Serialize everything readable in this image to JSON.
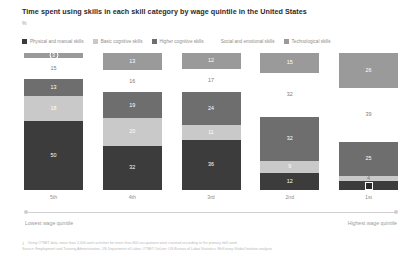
{
  "header": {
    "title": "Time spent using skills in each skill category by wage quintile in the United States",
    "subtitle": "%"
  },
  "legend": {
    "items": [
      {
        "label": "Physical and manual skills",
        "color": "#3c3c3c"
      },
      {
        "label": "Basic cognitive skills",
        "color": "#c9c9c9"
      },
      {
        "label": "Higher cognitive skills",
        "color": "#6e6e6e"
      },
      {
        "label": "Social and emotional skills",
        "color": "#ffffff"
      },
      {
        "label": "Technological skills",
        "color": "#9a9a9a"
      }
    ]
  },
  "axis": {
    "low_label": "Lowest wage quintile",
    "high_label": "Highest wage quintile"
  },
  "footnotes": {
    "mark": "1",
    "note": "Using O*NET data, more than 2,000 work activities for more than 800 occupations were counted according to the primary skill used.",
    "source": "Source: Employment and Training Administration, US Department of Labor, O*NET OnLine; US Bureau of Labor Statistics; McKinsey Global Institute analysis"
  },
  "chart_data": {
    "type": "bar",
    "title": "Time spent using skills in each skill category by wage quintile in the United States",
    "subtitle": "%",
    "xlabel": "",
    "ylabel": "%",
    "ylim": [
      0,
      100
    ],
    "grid": false,
    "legend_position": "top",
    "stacked": true,
    "categories": [
      "5th",
      "4th",
      "3rd",
      "2nd",
      "1st"
    ],
    "series": [
      {
        "name": "Technological skills",
        "color": "#9a9a9a",
        "values": [
          3,
          13,
          12,
          15,
          26
        ]
      },
      {
        "name": "Social and emotional skills",
        "color": "#ffffff",
        "values": [
          15,
          16,
          17,
          32,
          39
        ]
      },
      {
        "name": "Higher cognitive skills",
        "color": "#6e6e6e",
        "values": [
          13,
          19,
          24,
          32,
          25
        ]
      },
      {
        "name": "Basic cognitive skills",
        "color": "#c9c9c9",
        "values": [
          18,
          20,
          11,
          9,
          4
        ]
      },
      {
        "name": "Physical and manual skills",
        "color": "#3c3c3c",
        "values": [
          50,
          32,
          36,
          12,
          6
        ]
      }
    ]
  },
  "columns": [
    {
      "name": "5th",
      "segments": [
        {
          "value": "3",
          "color": "#9a9a9a",
          "text": "#ffffff",
          "pct": 3,
          "marker": "circle"
        },
        {
          "value": "15",
          "color": "#ffffff",
          "text": "#7a7a7a",
          "pct": 15,
          "marker": "none"
        },
        {
          "value": "13",
          "color": "#6e6e6e",
          "text": "#ffffff",
          "pct": 13,
          "marker": "none"
        },
        {
          "value": "18",
          "color": "#c9c9c9",
          "text": "#ffffff",
          "pct": 18,
          "marker": "none"
        },
        {
          "value": "50",
          "color": "#3c3c3c",
          "text": "#ffffff",
          "pct": 50,
          "marker": "none"
        }
      ]
    },
    {
      "name": "4th",
      "segments": [
        {
          "value": "13",
          "color": "#9a9a9a",
          "text": "#ffffff",
          "pct": 13,
          "marker": "none"
        },
        {
          "value": "16",
          "color": "#ffffff",
          "text": "#7a7a7a",
          "pct": 16,
          "marker": "none"
        },
        {
          "value": "19",
          "color": "#6e6e6e",
          "text": "#ffffff",
          "pct": 19,
          "marker": "none"
        },
        {
          "value": "20",
          "color": "#c9c9c9",
          "text": "#ffffff",
          "pct": 20,
          "marker": "none"
        },
        {
          "value": "32",
          "color": "#3c3c3c",
          "text": "#ffffff",
          "pct": 32,
          "marker": "none"
        }
      ]
    },
    {
      "name": "3rd",
      "segments": [
        {
          "value": "12",
          "color": "#9a9a9a",
          "text": "#ffffff",
          "pct": 12,
          "marker": "none"
        },
        {
          "value": "17",
          "color": "#ffffff",
          "text": "#7a7a7a",
          "pct": 17,
          "marker": "none"
        },
        {
          "value": "24",
          "color": "#6e6e6e",
          "text": "#ffffff",
          "pct": 24,
          "marker": "none"
        },
        {
          "value": "11",
          "color": "#c9c9c9",
          "text": "#ffffff",
          "pct": 11,
          "marker": "none"
        },
        {
          "value": "36",
          "color": "#3c3c3c",
          "text": "#ffffff",
          "pct": 36,
          "marker": "none"
        }
      ]
    },
    {
      "name": "2nd",
      "segments": [
        {
          "value": "15",
          "color": "#9a9a9a",
          "text": "#ffffff",
          "pct": 15,
          "marker": "none"
        },
        {
          "value": "32",
          "color": "#ffffff",
          "text": "#7a7a7a",
          "pct": 32,
          "marker": "none"
        },
        {
          "value": "32",
          "color": "#6e6e6e",
          "text": "#ffffff",
          "pct": 32,
          "marker": "none"
        },
        {
          "value": "9",
          "color": "#c9c9c9",
          "text": "#ffffff",
          "pct": 9,
          "marker": "none"
        },
        {
          "value": "12",
          "color": "#3c3c3c",
          "text": "#ffffff",
          "pct": 12,
          "marker": "none"
        }
      ]
    },
    {
      "name": "1st",
      "segments": [
        {
          "value": "26",
          "color": "#9a9a9a",
          "text": "#ffffff",
          "pct": 26,
          "marker": "none"
        },
        {
          "value": "39",
          "color": "#ffffff",
          "text": "#7a7a7a",
          "pct": 39,
          "marker": "none"
        },
        {
          "value": "25",
          "color": "#6e6e6e",
          "text": "#ffffff",
          "pct": 25,
          "marker": "none"
        },
        {
          "value": "4",
          "color": "#c9c9c9",
          "text": "#7a7a7a",
          "pct": 4,
          "marker": "none"
        },
        {
          "value": "6",
          "color": "#3c3c3c",
          "text": "#ffffff",
          "pct": 6,
          "marker": "solid"
        }
      ]
    }
  ]
}
